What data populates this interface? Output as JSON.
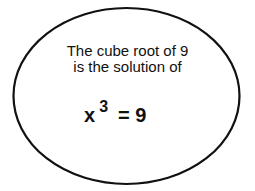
{
  "diagram": {
    "shape": "ellipse",
    "stroke_color": "#111111",
    "fill_color": "#ffffff",
    "text_lines": [
      "The cube root of 9",
      "is the solution of"
    ],
    "equation": {
      "base": "x",
      "exponent": "3",
      "rest": "= 9"
    }
  }
}
